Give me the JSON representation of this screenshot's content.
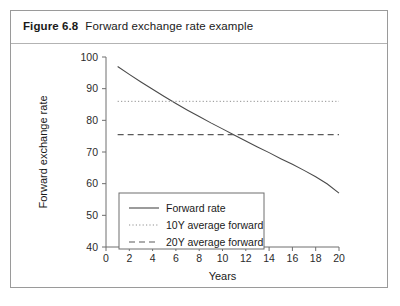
{
  "figure": {
    "label": "Figure 6.8",
    "caption": "Forward exchange rate example"
  },
  "chart_data": {
    "type": "line",
    "title": "Forward exchange rate example",
    "xlabel": "Years",
    "ylabel": "Forward exchange rate",
    "xlim": [
      0,
      20
    ],
    "ylim": [
      40,
      100
    ],
    "xticks": [
      0,
      2,
      4,
      6,
      8,
      10,
      12,
      14,
      16,
      18,
      20
    ],
    "yticks": [
      40,
      50,
      60,
      70,
      80,
      90,
      100
    ],
    "grid": false,
    "legend_position": "lower left",
    "series": [
      {
        "name": "Forward rate",
        "style": "solid",
        "color": "#4a4a4a",
        "x": [
          1,
          2,
          3,
          4,
          5,
          6,
          7,
          8,
          9,
          10,
          11,
          12,
          13,
          14,
          15,
          16,
          17,
          18,
          19,
          20
        ],
        "values": [
          97.0,
          94.5,
          92.1,
          89.8,
          87.5,
          85.3,
          83.2,
          81.2,
          79.2,
          77.3,
          75.4,
          73.5,
          71.6,
          69.8,
          67.9,
          66.1,
          64.2,
          62.2,
          59.9,
          57.0
        ]
      },
      {
        "name": "10Y average forward",
        "style": "dotted",
        "color": "#8f8f8f",
        "x": [
          1,
          20
        ],
        "values": [
          86.0,
          86.0
        ]
      },
      {
        "name": "20Y average forward",
        "style": "dashed",
        "color": "#5a5a5a",
        "x": [
          1,
          20
        ],
        "values": [
          75.5,
          75.5
        ]
      }
    ],
    "legend": [
      {
        "label": "Forward rate",
        "style": "solid"
      },
      {
        "label": "10Y average forward",
        "style": "dotted"
      },
      {
        "label": "20Y average forward",
        "style": "dashed"
      }
    ]
  }
}
